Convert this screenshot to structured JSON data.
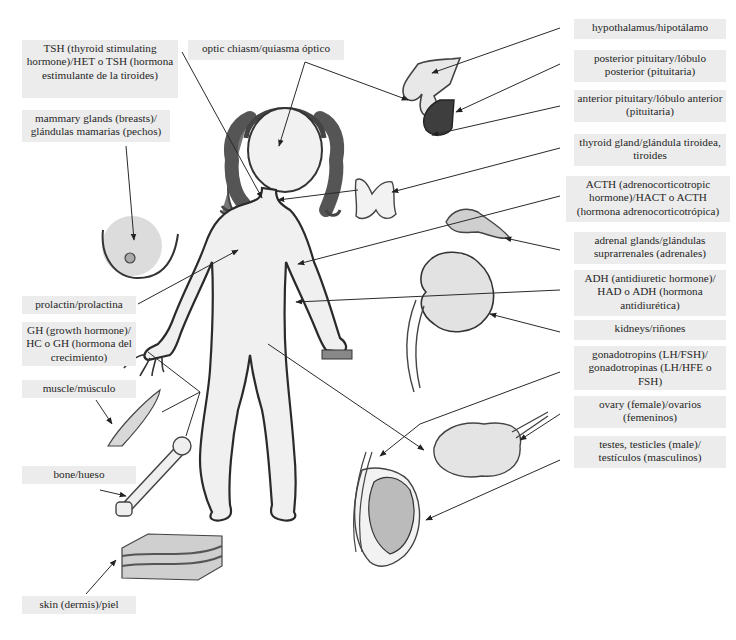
{
  "diagram": {
    "type": "endocrine-system-illustration",
    "colors": {
      "label_bg": "#ececec",
      "line": "#2a2a2a",
      "body_fill": "#f0f0f0",
      "hair": "#6a6a6a",
      "pituitary_dark": "#3a3a3a"
    },
    "labels": {
      "tsh": "TSH (thyroid stimulating hormone)/HET o TSH (hormona estimulante de la tiroides)",
      "optic_chiasm": "optic chiasm/quiasma óptico",
      "mammary": "mammary glands (breasts)/ glándulas mamarias (pechos)",
      "prolactin": "prolactin/prolactina",
      "gh": "GH (growth hormone)/ HC o GH (hormona del crecimiento)",
      "muscle": "muscle/músculo",
      "bone": "bone/hueso",
      "skin": "skin (dermis)/piel",
      "hypothalamus": "hypothalamus/hipotálamo",
      "posterior_pituitary": "posterior pituitary/lóbulo posterior (pituitaria)",
      "anterior_pituitary": "anterior pituitary/lóbulo anterior (pituitaria)",
      "thyroid": "thyroid gland/glándula tiroidea, tiroides",
      "acth": "ACTH (adrenocorticotropic hormone)/HACT o ACTH (hormona adrenocorticotrópica)",
      "adrenal": "adrenal glands/glándulas suprarrenales (adrenales)",
      "adh": "ADH (antidiuretic hormone)/ HAD o ADH (hormona antidiurética)",
      "kidneys": "kidneys/riñones",
      "gonadotropins": "gonadotropins (LH/FSH)/ gonadotropinas (LH/HFE o FSH)",
      "ovary": "ovary (female)/ovarios (femeninos)",
      "testes": "testes, testicles (male)/ testículos (masculinos)"
    },
    "illustrations": [
      "child-figure",
      "hypothalamus-pituitary",
      "thyroid-gland",
      "adrenal-gland",
      "kidney",
      "ovary",
      "testis",
      "breast",
      "muscle",
      "bone",
      "skin-block"
    ]
  }
}
